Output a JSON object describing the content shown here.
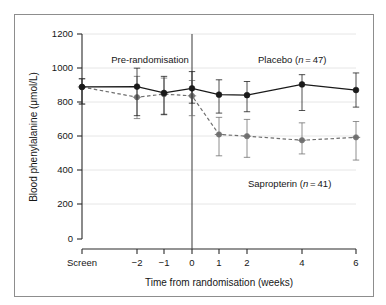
{
  "chart_data": {
    "type": "line",
    "title": "",
    "xlabel": "Time from randomisation (weeks)",
    "ylabel": "Blood phenylalanine (μmol/L)",
    "ylim": [
      0,
      1200
    ],
    "yticks": [
      0,
      200,
      400,
      600,
      800,
      1000,
      1200
    ],
    "ytick_labels": [
      "0",
      "200",
      "400",
      "600",
      "800",
      "1000",
      "1200"
    ],
    "x": [
      -3,
      -2,
      -1,
      0,
      1,
      2,
      4,
      6
    ],
    "categories": [
      "Screen",
      "−2",
      "−1",
      "0",
      "1",
      "2",
      "4",
      "6"
    ],
    "grid": "horizontal-faint",
    "legend": "inline-annotations",
    "series": [
      {
        "name": "Placebo",
        "n": 47,
        "label": "Placebo (n = 47)",
        "style": "solid",
        "marker": "filled-circle",
        "color": "#1a1a1a",
        "values": [
          890,
          892,
          855,
          882,
          845,
          842,
          905,
          872
        ],
        "err_low": [
          790,
          722,
          730,
          795,
          737,
          745,
          752,
          772
        ],
        "err_high": [
          938,
          1000,
          952,
          980,
          932,
          922,
          962,
          972
        ]
      },
      {
        "name": "Sapropterin",
        "n": 41,
        "label": "Sapropterin (n = 41)",
        "style": "dashed",
        "marker": "plus-circle",
        "color": "#6e6e6e",
        "values": [
          890,
          830,
          848,
          838,
          612,
          602,
          578,
          595
        ],
        "err_low": [
          790,
          705,
          727,
          722,
          487,
          478,
          498,
          462
        ],
        "err_high": [
          938,
          952,
          942,
          928,
          712,
          700,
          680,
          688
        ]
      }
    ],
    "annotations": [
      {
        "id": "pre-randomisation",
        "text": "Pre-randomisation",
        "x": 135,
        "y": 48
      },
      {
        "id": "placebo-label",
        "text": "Placebo (",
        "x": 243,
        "y": 48
      },
      {
        "id": "sapropterin-label",
        "text": "Sapropterin (",
        "x": 233,
        "y": 172
      }
    ],
    "vline": {
      "at_x": 0,
      "label": "randomisation"
    }
  },
  "axes": {
    "y_title": "Blood phenylalanine (μmol/L)",
    "x_title": "Time from randomisation (weeks)",
    "y_tick_0": "0",
    "y_tick_200": "200",
    "y_tick_400": "400",
    "y_tick_600": "600",
    "y_tick_800": "800",
    "y_tick_1000": "1000",
    "y_tick_1200": "1200",
    "x_tick_screen": "Screen",
    "x_tick_m2": "−2",
    "x_tick_m1": "−1",
    "x_tick_0": "0",
    "x_tick_1": "1",
    "x_tick_2": "2",
    "x_tick_4": "4",
    "x_tick_6": "6"
  },
  "labels": {
    "pre_randomisation": "Pre-randomisation",
    "placebo_name": "Placebo (",
    "placebo_n_italic": "n",
    "placebo_n_value": " = 47)",
    "sapropterin_name": "Sapropterin (",
    "sapropterin_n_italic": "n",
    "sapropterin_n_value": " = 41)"
  },
  "colors": {
    "placebo": "#1a1a1a",
    "sapropterin": "#6e6e6e",
    "axis": "#2b2b2b",
    "grid": "#e2e2e2",
    "frame": "#8d8d8d"
  }
}
